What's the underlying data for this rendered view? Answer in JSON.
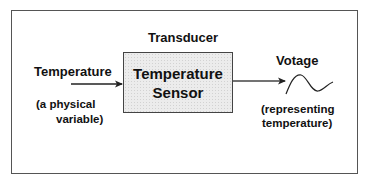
{
  "diagram": {
    "block_title": "Transducer",
    "block": {
      "line1": "Temperature",
      "line2": "Sensor"
    },
    "input": {
      "label": "Temperature",
      "note_line1": "(a physical",
      "note_line2": "variable)"
    },
    "output": {
      "label": "Votage",
      "note_line1": "(representing",
      "note_line2": "temperature)",
      "signal_icon": "waveform"
    },
    "colors": {
      "block_fill": "#ececec",
      "stroke": "#333333",
      "text": "#111111"
    }
  }
}
